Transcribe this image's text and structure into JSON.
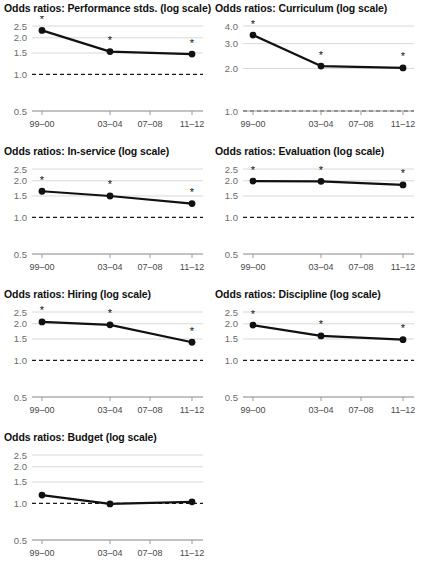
{
  "figure": {
    "title_prefix": "Odds ratios: ",
    "title_suffix": " (log scale)",
    "significance_marker": "*"
  },
  "chart_data": [
    {
      "type": "line",
      "title": "Odds ratios: Performance stds. (log scale)",
      "panel_name": "Performance stds.",
      "xlabel": "",
      "ylabel": "",
      "x": [
        "99–00",
        "03–04",
        "07–08",
        "11–12"
      ],
      "categories": [
        "99–00",
        "03–04",
        "07–08",
        "11–12"
      ],
      "xtick_labels": [
        "99–00",
        "03–04",
        "07–08",
        "11–12"
      ],
      "ytick_labels": [
        "2.5",
        "2.0",
        "1.5",
        "1.0",
        "0.5"
      ],
      "ytick_values": [
        2.5,
        2.0,
        1.5,
        1.0,
        0.5
      ],
      "ylim": [
        0.5,
        2.65
      ],
      "log_scale": true,
      "grid": true,
      "legend": "none",
      "reference_line": 1.0,
      "points": [
        {
          "x": "99–00",
          "y": 2.3,
          "significant": true
        },
        {
          "x": "03–04",
          "y": 1.54,
          "significant": true
        },
        {
          "x": "11–12",
          "y": 1.47,
          "significant": true
        }
      ],
      "values": [
        2.3,
        1.54,
        null,
        1.47
      ]
    },
    {
      "type": "line",
      "title": "Odds ratios: Curriculum (log scale)",
      "panel_name": "Curriculum",
      "xlabel": "",
      "ylabel": "",
      "x": [
        "99–00",
        "03–04",
        "07–08",
        "11–12"
      ],
      "categories": [
        "99–00",
        "03–04",
        "07–08",
        "11–12"
      ],
      "xtick_labels": [
        "99–00",
        "03–04",
        "07–08",
        "11–12"
      ],
      "ytick_labels": [
        "4.0",
        "3.0",
        "2.0",
        "1.0"
      ],
      "ytick_values": [
        4.0,
        3.0,
        2.0,
        1.0
      ],
      "ylim": [
        0.5,
        4.2
      ],
      "log_scale": true,
      "grid": true,
      "legend": "none",
      "reference_line": 1.0,
      "points": [
        {
          "x": "99–00",
          "y": 3.45,
          "significant": true
        },
        {
          "x": "03–04",
          "y": 2.08,
          "significant": true
        },
        {
          "x": "11–12",
          "y": 2.02,
          "significant": true
        }
      ],
      "values": [
        3.45,
        2.08,
        null,
        2.02
      ]
    },
    {
      "type": "line",
      "title": "Odds ratios: In-service (log scale)",
      "panel_name": "In-service",
      "xlabel": "",
      "ylabel": "",
      "x": [
        "99–00",
        "03–04",
        "07–08",
        "11–12"
      ],
      "categories": [
        "99–00",
        "03–04",
        "07–08",
        "11–12"
      ],
      "xtick_labels": [
        "99–00",
        "03–04",
        "07–08",
        "11–12"
      ],
      "ytick_labels": [
        "2.5",
        "2.0",
        "1.5",
        "1.0",
        "0.5"
      ],
      "ytick_values": [
        2.5,
        2.0,
        1.5,
        1.0,
        0.5
      ],
      "ylim": [
        0.5,
        2.65
      ],
      "log_scale": true,
      "grid": true,
      "legend": "none",
      "reference_line": 1.0,
      "points": [
        {
          "x": "99–00",
          "y": 1.64,
          "significant": true
        },
        {
          "x": "03–04",
          "y": 1.5,
          "significant": true
        },
        {
          "x": "11–12",
          "y": 1.3,
          "significant": true
        }
      ],
      "values": [
        1.64,
        1.5,
        null,
        1.3
      ]
    },
    {
      "type": "line",
      "title": "Odds ratios: Evaluation (log scale)",
      "panel_name": "Evaluation",
      "xlabel": "",
      "ylabel": "",
      "x": [
        "99–00",
        "03–04",
        "07–08",
        "11–12"
      ],
      "categories": [
        "99–00",
        "03–04",
        "07–08",
        "11–12"
      ],
      "xtick_labels": [
        "99–00",
        "03–04",
        "07–08",
        "11–12"
      ],
      "ytick_labels": [
        "2.5",
        "2.0",
        "1.5",
        "1.0",
        "0.5"
      ],
      "ytick_values": [
        2.5,
        2.0,
        1.5,
        1.0,
        0.5
      ],
      "ylim": [
        0.5,
        2.65
      ],
      "log_scale": true,
      "grid": true,
      "legend": "none",
      "reference_line": 1.0,
      "points": [
        {
          "x": "99–00",
          "y": 1.99,
          "significant": true
        },
        {
          "x": "03–04",
          "y": 1.98,
          "significant": true
        },
        {
          "x": "11–12",
          "y": 1.85,
          "significant": true
        }
      ],
      "values": [
        1.99,
        1.98,
        null,
        1.85
      ]
    },
    {
      "type": "line",
      "title": "Odds ratios: Hiring (log scale)",
      "panel_name": "Hiring",
      "xlabel": "",
      "ylabel": "",
      "x": [
        "99–00",
        "03–04",
        "07–08",
        "11–12"
      ],
      "categories": [
        "99–00",
        "03–04",
        "07–08",
        "11–12"
      ],
      "xtick_labels": [
        "99–00",
        "03–04",
        "07–08",
        "11–12"
      ],
      "ytick_labels": [
        "2.5",
        "2.0",
        "1.5",
        "1.0",
        "0.5"
      ],
      "ytick_values": [
        2.5,
        2.0,
        1.5,
        1.0,
        0.5
      ],
      "ylim": [
        0.5,
        2.65
      ],
      "log_scale": true,
      "grid": true,
      "legend": "none",
      "reference_line": 1.0,
      "points": [
        {
          "x": "99–00",
          "y": 2.07,
          "significant": true
        },
        {
          "x": "03–04",
          "y": 1.96,
          "significant": true
        },
        {
          "x": "11–12",
          "y": 1.41,
          "significant": true
        }
      ],
      "values": [
        2.07,
        1.96,
        null,
        1.41
      ]
    },
    {
      "type": "line",
      "title": "Odds ratios: Discipline (log scale)",
      "panel_name": "Discipline",
      "xlabel": "",
      "ylabel": "",
      "x": [
        "99–00",
        "03–04",
        "07–08",
        "11–12"
      ],
      "categories": [
        "99–00",
        "03–04",
        "07–08",
        "11–12"
      ],
      "xtick_labels": [
        "99–00",
        "03–04",
        "07–08",
        "11–12"
      ],
      "ytick_labels": [
        "2.5",
        "2.0",
        "1.5",
        "1.0",
        "0.5"
      ],
      "ytick_values": [
        2.5,
        2.0,
        1.5,
        1.0,
        0.5
      ],
      "ylim": [
        0.5,
        2.65
      ],
      "log_scale": true,
      "grid": true,
      "legend": "none",
      "reference_line": 1.0,
      "points": [
        {
          "x": "99–00",
          "y": 1.95,
          "significant": true
        },
        {
          "x": "03–04",
          "y": 1.59,
          "significant": true
        },
        {
          "x": "11–12",
          "y": 1.48,
          "significant": true
        }
      ],
      "values": [
        1.95,
        1.59,
        null,
        1.48
      ]
    },
    {
      "type": "line",
      "title": "Odds ratios: Budget (log scale)",
      "panel_name": "Budget",
      "xlabel": "",
      "ylabel": "",
      "x": [
        "99–00",
        "03–04",
        "07–08",
        "11–12"
      ],
      "categories": [
        "99–00",
        "03–04",
        "07–08",
        "11–12"
      ],
      "xtick_labels": [
        "99–00",
        "03–04",
        "07–08",
        "11–12"
      ],
      "ytick_labels": [
        "2.5",
        "2.0",
        "1.5",
        "1.0",
        "0.5"
      ],
      "ytick_values": [
        2.5,
        2.0,
        1.5,
        1.0,
        0.5
      ],
      "ylim": [
        0.5,
        2.65
      ],
      "log_scale": true,
      "grid": true,
      "legend": "none",
      "reference_line": 1.0,
      "points": [
        {
          "x": "99–00",
          "y": 1.17,
          "significant": false
        },
        {
          "x": "03–04",
          "y": 0.99,
          "significant": false
        },
        {
          "x": "11–12",
          "y": 1.03,
          "significant": false
        }
      ],
      "values": [
        1.17,
        0.99,
        null,
        1.03
      ]
    }
  ],
  "colors": {
    "line": "#111111",
    "marker": "#111111",
    "grid": "#d8d8d8",
    "axis": "#9a9a9a",
    "reference": "#1a1a1a",
    "title_text": "#111111",
    "ytick_text": "#6b6b6b",
    "xtick_text": "#4a4a4a",
    "background": "#ffffff"
  }
}
